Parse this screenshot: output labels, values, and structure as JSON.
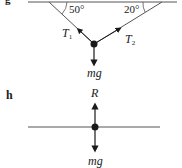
{
  "diagrams": [
    {
      "label": "g",
      "angles": [
        "50°",
        "20°"
      ],
      "forces": {
        "t1": {
          "symbol": "T",
          "subscript": "1"
        },
        "t2": {
          "symbol": "T",
          "subscript": "2"
        },
        "weight": "mg"
      }
    },
    {
      "label": "h",
      "forces": {
        "reaction": "R",
        "weight": "mg"
      }
    }
  ],
  "colors": {
    "line": "#555555",
    "ink": "#1a1a1a"
  }
}
